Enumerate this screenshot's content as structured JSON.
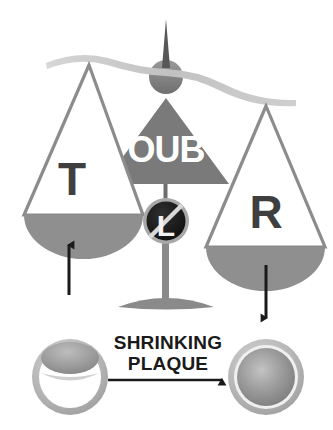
{
  "figure": {
    "background_color": "#ffffff"
  },
  "scale": {
    "left_pan": {
      "label": "T",
      "label_color": "#3f3f3f",
      "outline_color": "#8c8c8c",
      "fill_color": "#8f8f8f"
    },
    "right_pan": {
      "label": "R",
      "label_color": "#3f3f3f",
      "outline_color": "#8c8c8c",
      "fill_color": "#8f8f8f"
    },
    "fulcrum": {
      "label": "OUB",
      "label_color": "#ffffff",
      "fill_color": "#7a7a7a"
    },
    "beam": {
      "color": "#c9c9c9"
    },
    "pivot_knob": {
      "color": "#808080"
    },
    "pointer_needle": {
      "color": "#6e6e6e"
    },
    "base": {
      "color": "#8a8a8a"
    }
  },
  "badge": {
    "label": "L",
    "label_color": "#f2f2f2",
    "disc_color": "#1c1c1c",
    "ring_color": "#a8a8a8",
    "slash_color": "#d8d8d8",
    "meaning": "no-L-prohibition-badge"
  },
  "arrows": {
    "left_up": {
      "name": "arrow-up-left",
      "direction": "up",
      "color": "#1a1a1a"
    },
    "right_down": {
      "name": "arrow-down-right",
      "direction": "down",
      "color": "#1a1a1a"
    },
    "transition": {
      "name": "arrow-right-transition",
      "direction": "right",
      "color": "#1a1a1a"
    }
  },
  "caption": {
    "line1": "SHRINKING",
    "line2": "PLAQUE",
    "color": "#1a1a1a"
  },
  "vessels": {
    "before": {
      "name": "vessel-with-plaque",
      "wall_color": "#b4b4b4",
      "inner_color": "#ffffff",
      "plaque_color": "#9a9a9a"
    },
    "after": {
      "name": "vessel-open-lumen",
      "wall_color": "#b4b4b4",
      "lumen_color": "#8e8e8e"
    }
  }
}
